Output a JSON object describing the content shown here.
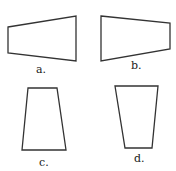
{
  "figure": {
    "stroke_color": "#333333",
    "shapes": [
      {
        "id": "a",
        "label": "a.",
        "points": "8,27 76,16 76,61 8,53",
        "label_x": 36,
        "label_y": 64
      },
      {
        "id": "b",
        "label": "b.",
        "points": "101,16 170,23 170,49 101,61",
        "label_x": 131,
        "label_y": 60
      },
      {
        "id": "c",
        "label": "c.",
        "points": "28,88 57,88 66,150 22,150",
        "label_x": 39,
        "label_y": 157
      },
      {
        "id": "d",
        "label": "d.",
        "points": "115,86 158,86 152,148 125,148",
        "label_x": 134,
        "label_y": 153
      }
    ]
  }
}
